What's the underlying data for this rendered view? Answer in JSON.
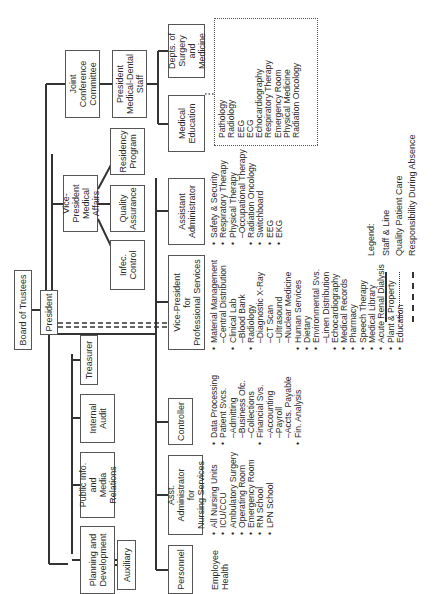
{
  "chart_title": "Hospital Organizational Chart",
  "nodes": {
    "board": "Board of Trustees",
    "president": "President",
    "joint_conference": "Joint\nConference\nCommittee",
    "president_medical_dental": "President\nMedical-Dental\nStaff",
    "depts_surgery_medicine": "Depts. of\nSurgery and\nMedicine",
    "medical_education": "Medical\nEducation",
    "vp_medical_affairs": "Vice-President\nMedical\nAffairs",
    "infec_control": "Infec.\nControl",
    "quality_assurance": "Quality\nAssurance",
    "residency_program": "Residency\nProgram",
    "assistant_administrator": "Assistant\nAdministrator",
    "vp_professional_services": "Vice-President\nfor\nProfessional Services",
    "treasurer": "Treasurer",
    "internal_audit": "Internal\nAudit",
    "public_info": "Public Info.\nand\nMedia Relations",
    "planning_development": "Planning and\nDevelopment",
    "auxiliary": "Auxiliary",
    "controller": "Controller",
    "asst_admin_nursing": "Asst. Administrator\nfor\nNursing Services",
    "personnel": "Personnel"
  },
  "lists": {
    "personnel": [
      {
        "text": "Employee\nHealth",
        "type": "plain"
      }
    ],
    "nursing": [
      {
        "text": "All Nursing Units",
        "type": "bullet"
      },
      {
        "text": "ICU/CCU",
        "type": "bullet"
      },
      {
        "text": "Ambulatory Surgery",
        "type": "bullet"
      },
      {
        "text": "Operating Room",
        "type": "bullet"
      },
      {
        "text": "Emergency Room",
        "type": "bullet"
      },
      {
        "text": "RN School",
        "type": "bullet"
      },
      {
        "text": "LPN School",
        "type": "bullet"
      }
    ],
    "controller": [
      {
        "text": "Data Processing",
        "type": "bullet"
      },
      {
        "text": "Patient Svcs.",
        "type": "bullet"
      },
      {
        "text": "–Admitting",
        "type": "sub"
      },
      {
        "text": "–Business Ofc.",
        "type": "sub"
      },
      {
        "text": "–Collections",
        "type": "sub"
      },
      {
        "text": "Financial Svs.",
        "type": "bullet"
      },
      {
        "text": "–Accounting",
        "type": "sub"
      },
      {
        "text": "–Payroll",
        "type": "sub"
      },
      {
        "text": "–Accts. Payable",
        "type": "sub"
      },
      {
        "text": "Fin. Analysis",
        "type": "bullet"
      }
    ],
    "professional_services": [
      {
        "text": "Material Management",
        "type": "bullet"
      },
      {
        "text": "–Central Distribution",
        "type": "sub"
      },
      {
        "text": "Clinical Lab",
        "type": "bullet"
      },
      {
        "text": "–Blood Bank",
        "type": "sub"
      },
      {
        "text": "Radiology",
        "type": "bullet"
      },
      {
        "text": "–Diagnostic X-Ray",
        "type": "sub"
      },
      {
        "text": "–CT Scan",
        "type": "sub"
      },
      {
        "text": "–Ultrasound",
        "type": "sub"
      },
      {
        "text": "–Nuclear Medicine",
        "type": "sub"
      },
      {
        "text": "Human Services",
        "type": "bullet"
      },
      {
        "text": "Dietary",
        "type": "bullet"
      },
      {
        "text": "Environmental Svs.",
        "type": "bullet"
      },
      {
        "text": "–Linen Distribution",
        "type": "sub"
      },
      {
        "text": "Echocardiography",
        "type": "bullet"
      },
      {
        "text": "Medical Records",
        "type": "bullet"
      },
      {
        "text": "Pharmacy",
        "type": "bullet"
      },
      {
        "text": "Speech Therapy",
        "type": "bullet"
      },
      {
        "text": "Medical Library",
        "type": "bullet"
      },
      {
        "text": "Acute Renal Dialysis",
        "type": "bullet"
      },
      {
        "text": "Plant & Property",
        "type": "bullet"
      },
      {
        "text": "Education",
        "type": "bullet"
      }
    ],
    "assistant_administrator": [
      {
        "text": "Safety & Security",
        "type": "bullet"
      },
      {
        "text": "Respiratory Therapy",
        "type": "bullet"
      },
      {
        "text": "Physical Therapy",
        "type": "bullet"
      },
      {
        "text": "–Occupational Therapy",
        "type": "sub"
      },
      {
        "text": "Radiation Oncology",
        "type": "bullet"
      },
      {
        "text": "Switchboard",
        "type": "bullet"
      },
      {
        "text": "EEG",
        "type": "bullet"
      },
      {
        "text": "EKG",
        "type": "bullet"
      }
    ],
    "quality_patient_care": [
      {
        "text": "Pathology",
        "type": "plain"
      },
      {
        "text": "Radiology",
        "type": "plain"
      },
      {
        "text": "EEG",
        "type": "plain"
      },
      {
        "text": "ECG",
        "type": "plain"
      },
      {
        "text": "Echocardiography",
        "type": "plain"
      },
      {
        "text": "Respiratory Therapy",
        "type": "plain"
      },
      {
        "text": "Emergency Room",
        "type": "plain"
      },
      {
        "text": "Physical Medicine",
        "type": "plain"
      },
      {
        "text": "Radiation Oncology",
        "type": "plain"
      }
    ]
  },
  "legend": {
    "title": "Legend:",
    "items": [
      {
        "style": "solid",
        "label": "Staff & Line"
      },
      {
        "style": "dotted",
        "label": "Quality Patient Care"
      },
      {
        "style": "dashed",
        "label": "Responsibility During Absence"
      }
    ]
  }
}
